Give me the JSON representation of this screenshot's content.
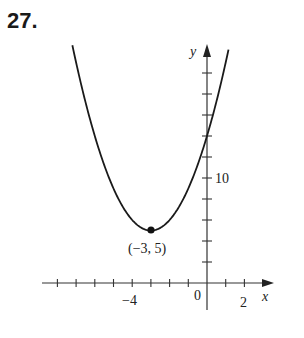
{
  "problem": {
    "number": "27."
  },
  "chart_data": {
    "type": "line",
    "title": "",
    "function": "y = (x + 3)^2 + 5",
    "xlabel": "x",
    "ylabel": "y",
    "x_tick_labels": [
      "-4",
      "0",
      "2"
    ],
    "y_tick_labels": [
      "10"
    ],
    "xlim": [
      -8,
      3
    ],
    "ylim": [
      -2,
      23
    ],
    "x_tick_step": 1,
    "y_tick_step": 2,
    "grid": false,
    "annotations": [
      {
        "text": "(−3, 5)",
        "x": -3,
        "y": 5,
        "marker": "filled-dot"
      }
    ],
    "points": [
      {
        "x": -7.2,
        "y": 22.64
      },
      {
        "x": -7,
        "y": 21
      },
      {
        "x": -6,
        "y": 14
      },
      {
        "x": -5,
        "y": 9
      },
      {
        "x": -4,
        "y": 6
      },
      {
        "x": -3,
        "y": 5
      },
      {
        "x": -2,
        "y": 6
      },
      {
        "x": -1,
        "y": 9
      },
      {
        "x": 0,
        "y": 14
      },
      {
        "x": 1,
        "y": 21
      },
      {
        "x": 1.15,
        "y": 22.2
      }
    ],
    "colors": {
      "curve": "#1a1a1a",
      "axes": "#333333"
    }
  },
  "labels": {
    "x_axis": "x",
    "y_axis": "y",
    "x_neg4": "−4",
    "x_zero": "0",
    "x_two": "2",
    "y_ten": "10",
    "vertex": "(−3, 5)"
  }
}
